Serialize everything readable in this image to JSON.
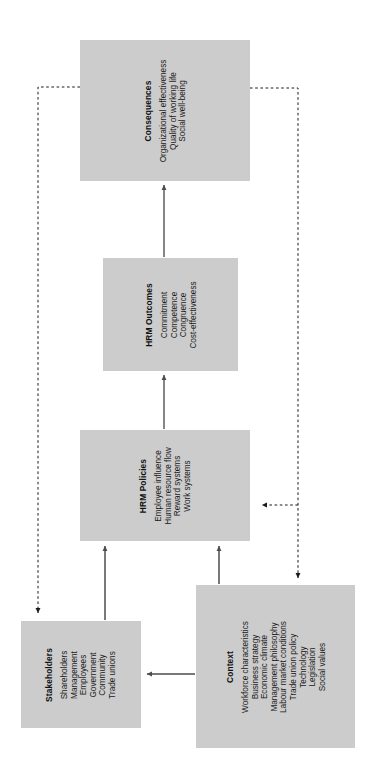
{
  "diagram": {
    "orientation": "rotated-90-ccw",
    "box_fill": "#cccccc",
    "text_color": "#1a1a1a",
    "line_color": "#555555",
    "boxes": [
      {
        "id": "consequences",
        "title": "Consequences",
        "items": [
          "Organizational effectiveness",
          "Quality of working life",
          "Social well-being"
        ]
      },
      {
        "id": "hrm-outcomes",
        "title": "HRM Outcomes",
        "items": [
          "Commitment",
          "Competence",
          "Congruence",
          "Cost-effectiveness"
        ]
      },
      {
        "id": "hrm-policies",
        "title": "HRM Policies",
        "items": [
          "Employee influence",
          "Human resource flow",
          "Reward systems",
          "Work systems"
        ]
      },
      {
        "id": "stakeholders",
        "title": "Stakeholders",
        "items": [
          "Shareholders",
          "Management",
          "Employees",
          "Government",
          "Community",
          "Trade unions"
        ]
      },
      {
        "id": "context",
        "title": "Context",
        "items": [
          "Workforce characteristics",
          "Business strategy",
          "Economic climate",
          "Management philosophy",
          "Labour market conditions",
          "Trade union policy",
          "Technology",
          "Legislation",
          "Social values"
        ]
      }
    ],
    "connectors": [
      {
        "id": "stakeholders-to-policies",
        "style": "solid",
        "from": "stakeholders",
        "to": "hrm-policies"
      },
      {
        "id": "context-to-policies",
        "style": "solid",
        "from": "context",
        "to": "hrm-policies"
      },
      {
        "id": "context-to-stakeholders",
        "style": "solid",
        "from": "context",
        "to": "stakeholders"
      },
      {
        "id": "policies-to-outcomes",
        "style": "solid",
        "from": "hrm-policies",
        "to": "hrm-outcomes"
      },
      {
        "id": "outcomes-to-consequences",
        "style": "solid",
        "from": "hrm-outcomes",
        "to": "consequences"
      },
      {
        "id": "consequences-to-stakeholders",
        "style": "dashed",
        "from": "consequences",
        "to": "stakeholders"
      },
      {
        "id": "consequences-to-policies",
        "style": "dashed",
        "from": "consequences",
        "to": "hrm-policies"
      },
      {
        "id": "consequences-to-context",
        "style": "dashed",
        "from": "consequences",
        "to": "context"
      }
    ]
  }
}
